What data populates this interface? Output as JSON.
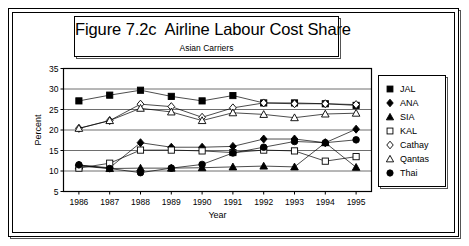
{
  "figure": {
    "title": "Figure 7.2c  Airline Labour Cost Share",
    "subtitle": "Asian Carriers"
  },
  "axes": {
    "ylabel": "Percent",
    "xlabel": "Year",
    "ytick_labels": [
      "35",
      "30",
      "25",
      "20",
      "15",
      "10",
      "5"
    ],
    "xtick_labels": [
      "1986",
      "1987",
      "1988",
      "1989",
      "1990",
      "1991",
      "1992",
      "1993",
      "1994",
      "1995"
    ]
  },
  "legend": {
    "items": [
      {
        "label": "JAL",
        "marker": "filled-square"
      },
      {
        "label": "ANA",
        "marker": "filled-diamond"
      },
      {
        "label": "SIA",
        "marker": "filled-triangle"
      },
      {
        "label": "KAL",
        "marker": "open-square"
      },
      {
        "label": "Cathay",
        "marker": "open-diamond"
      },
      {
        "label": "Qantas",
        "marker": "open-triangle"
      },
      {
        "label": "Thai",
        "marker": "filled-circle"
      }
    ]
  },
  "chart_data": {
    "type": "line",
    "title": "Figure 7.2c  Airline Labour Cost Share",
    "subtitle": "Asian Carriers",
    "xlabel": "Year",
    "ylabel": "Percent",
    "ylim": [
      5,
      35
    ],
    "ytick_step": 5,
    "grid": true,
    "legend_position": "right",
    "categories": [
      "1986",
      "1987",
      "1988",
      "1989",
      "1990",
      "1991",
      "1992",
      "1993",
      "1994",
      "1995"
    ],
    "series": [
      {
        "name": "JAL",
        "marker": "filled-square",
        "values": [
          27.1,
          28.5,
          29.7,
          28.2,
          27.1,
          28.4,
          26.6,
          26.6,
          26.4,
          26.0
        ]
      },
      {
        "name": "ANA",
        "marker": "filled-diamond",
        "values": [
          11.4,
          10.8,
          16.9,
          15.8,
          15.8,
          16.0,
          17.8,
          17.8,
          16.9,
          20.2
        ]
      },
      {
        "name": "SIA",
        "marker": "filled-triangle",
        "values": [
          11.2,
          10.6,
          10.7,
          10.7,
          10.8,
          11.0,
          11.2,
          11.0,
          16.9,
          10.9
        ]
      },
      {
        "name": "KAL",
        "marker": "open-square",
        "values": [
          10.7,
          11.9,
          15.1,
          15.1,
          14.9,
          14.5,
          15.1,
          14.9,
          12.4,
          13.5
        ]
      },
      {
        "name": "Cathay",
        "marker": "open-diamond",
        "values": [
          20.4,
          22.3,
          26.3,
          25.7,
          23.1,
          25.4,
          26.6,
          26.4,
          26.4,
          26.2
        ]
      },
      {
        "name": "Qantas",
        "marker": "open-triangle",
        "values": [
          20.4,
          22.3,
          25.3,
          24.4,
          22.3,
          24.2,
          23.8,
          23.0,
          23.9,
          24.1
        ]
      },
      {
        "name": "Thai",
        "marker": "filled-circle",
        "values": [
          11.5,
          10.6,
          9.6,
          10.7,
          11.6,
          14.4,
          15.8,
          17.2,
          16.9,
          17.6
        ]
      }
    ]
  }
}
